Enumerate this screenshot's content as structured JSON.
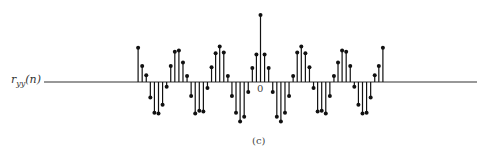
{
  "chart_data": {
    "type": "stem",
    "title": "",
    "ylabel_base": "r",
    "ylabel_sub": "yy",
    "ylabel_arg": "(n)",
    "xlabel": "",
    "x_tick_label": "0",
    "caption": "(c)",
    "x": [
      -30,
      -29,
      -28,
      -27,
      -26,
      -25,
      -24,
      -23,
      -22,
      -21,
      -20,
      -19,
      -18,
      -17,
      -16,
      -15,
      -14,
      -13,
      -12,
      -11,
      -10,
      -9,
      -8,
      -7,
      -6,
      -5,
      -4,
      -3,
      -2,
      -1,
      0,
      1,
      2,
      3,
      4,
      5,
      6,
      7,
      8,
      9,
      10,
      11,
      12,
      13,
      14,
      15,
      16,
      17,
      18,
      19,
      20,
      21,
      22,
      23,
      24,
      25,
      26,
      27,
      28,
      29,
      30
    ],
    "values": [
      0.51,
      0.24,
      0.1,
      -0.23,
      -0.46,
      -0.47,
      -0.34,
      -0.07,
      0.24,
      0.45,
      0.47,
      0.29,
      0.09,
      -0.21,
      -0.47,
      -0.43,
      -0.44,
      -0.09,
      0.22,
      0.43,
      0.53,
      0.44,
      0.09,
      -0.21,
      -0.46,
      -0.59,
      -0.52,
      -0.15,
      0.21,
      0.41,
      1.0,
      0.41,
      0.21,
      -0.15,
      -0.52,
      -0.59,
      -0.46,
      -0.21,
      0.09,
      0.44,
      0.53,
      0.43,
      0.22,
      -0.09,
      -0.44,
      -0.43,
      -0.47,
      -0.21,
      0.09,
      0.29,
      0.47,
      0.45,
      0.24,
      -0.07,
      -0.34,
      -0.47,
      -0.46,
      -0.23,
      0.1,
      0.24,
      0.51
    ],
    "xlim": [
      -53,
      53
    ],
    "axis_line": true,
    "grid": false,
    "legend": null
  },
  "layout": {
    "baseline_y": 82,
    "center_x": 260.5,
    "spacing": 4.08,
    "unit_px": 67,
    "axis_x_start": 44,
    "axis_x_end": 477,
    "stem_color": "#111111",
    "axis_color": "#333333"
  }
}
